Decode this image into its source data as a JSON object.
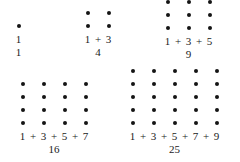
{
  "document": {
    "title": "Sum of consecutive odd numbers forming perfect squares",
    "background_color": "#ffffff",
    "dot_color": "#141414",
    "text_color": "#1a1a1a"
  },
  "figures": [
    {
      "id": "figure-1",
      "columns": 1,
      "rows": 1,
      "dot_count": 1,
      "terms": [
        "1"
      ],
      "plus": "+",
      "expression": "1",
      "total": "1"
    },
    {
      "id": "figure-2",
      "columns": 2,
      "rows": 2,
      "dot_count": 4,
      "terms": [
        "1",
        "3"
      ],
      "plus": "+",
      "expression": "1 + 3",
      "total": "4"
    },
    {
      "id": "figure-3",
      "columns": 3,
      "rows": 3,
      "dot_count": 9,
      "terms": [
        "1",
        "3",
        "5"
      ],
      "plus": "+",
      "expression": "1 + 3 + 5",
      "total": "9"
    },
    {
      "id": "figure-4",
      "columns": 4,
      "rows": 4,
      "dot_count": 16,
      "terms": [
        "1",
        "3",
        "5",
        "7"
      ],
      "plus": "+",
      "expression": "1 + 3 + 5 + 7",
      "total": "16"
    },
    {
      "id": "figure-5",
      "columns": 5,
      "rows": 5,
      "dot_count": 25,
      "terms": [
        "1",
        "3",
        "5",
        "7",
        "9"
      ],
      "plus": "+",
      "expression": "1 + 3 + 5 + 7 + 9",
      "total": "25"
    }
  ],
  "chart_data": {
    "type": "scatter",
    "xlabel": "",
    "ylabel": "",
    "categories": [
      "1",
      "1 + 3",
      "1 + 3 + 5",
      "1 + 3 + 5 + 7",
      "1 + 3 + 5 + 7 + 9"
    ],
    "values": [
      1,
      4,
      9,
      16,
      25
    ],
    "series": [
      {
        "name": "number of terms",
        "values": [
          1,
          2,
          3,
          4,
          5
        ]
      },
      {
        "name": "square side (dots per row)",
        "values": [
          1,
          2,
          3,
          4,
          5
        ]
      },
      {
        "name": "total dots",
        "values": [
          1,
          4,
          9,
          16,
          25
        ]
      }
    ],
    "annotations": [
      "1",
      "4",
      "9",
      "16",
      "25"
    ],
    "grid": false,
    "legend": "none"
  }
}
